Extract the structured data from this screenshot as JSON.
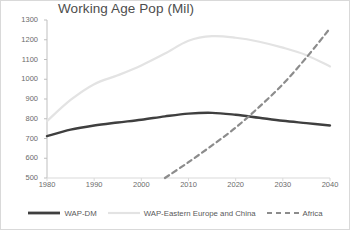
{
  "chart_data": {
    "type": "line",
    "title": "Working Age Pop (Mil)",
    "xlabel": "",
    "ylabel": "",
    "xlim": [
      1980,
      2040
    ],
    "ylim": [
      500,
      1300
    ],
    "grid": false,
    "legend_position": "bottom",
    "x_ticks": [
      "1980",
      "1990",
      "2000",
      "2010",
      "2020",
      "2030",
      "2040"
    ],
    "y_ticks": [
      "500",
      "600",
      "700",
      "800",
      "900",
      "1000",
      "1100",
      "1200",
      "1300"
    ],
    "x": [
      1980,
      1985,
      1990,
      1995,
      2000,
      2005,
      2010,
      2015,
      2020,
      2025,
      2030,
      2035,
      2040
    ],
    "series": [
      {
        "name": "WAP-DM",
        "color": "#3f3f3f",
        "style": "solid",
        "width": 2.4,
        "values": [
          712,
          745,
          766,
          781,
          795,
          812,
          826,
          830,
          820,
          805,
          790,
          778,
          766
        ]
      },
      {
        "name": "WAP-Eastern Europe and China",
        "color": "#e3e3e3",
        "style": "solid",
        "width": 2.2,
        "values": [
          788,
          895,
          975,
          1020,
          1070,
          1130,
          1195,
          1218,
          1210,
          1190,
          1160,
          1122,
          1065
        ]
      },
      {
        "name": "Africa",
        "color": "#8c8c8c",
        "style": "dashed",
        "width": 2.2,
        "values": [
          null,
          null,
          null,
          null,
          null,
          500,
          580,
          665,
          755,
          860,
          975,
          1110,
          1258
        ]
      }
    ],
    "annotations": []
  },
  "legend": {
    "items": [
      {
        "label": "WAP-DM",
        "marker": "solid-line-swatch"
      },
      {
        "label": "WAP-Eastern Europe and China",
        "marker": "light-line-swatch"
      },
      {
        "label": "Africa",
        "marker": "dashed-line-swatch"
      }
    ]
  },
  "colors": {
    "axis": "#bfbfbf",
    "tick_text": "#6b6b6b",
    "title_text": "#4d4d4d",
    "plot_background": "#ffffff",
    "series_wap_dm": "#3f3f3f",
    "series_eastern_europe_china": "#e3e3e3",
    "series_africa": "#8c8c8c"
  }
}
